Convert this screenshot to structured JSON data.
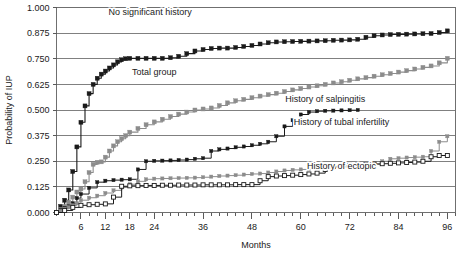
{
  "chart_data": {
    "type": "line",
    "title": "",
    "xlabel": "Months",
    "ylabel": "Probability of IUP",
    "xlim": [
      0,
      98
    ],
    "ylim": [
      0,
      1.0
    ],
    "grid": true,
    "legend_position": "inline-annotations",
    "xticklabels": [
      "6",
      "12",
      "18",
      "24",
      "36",
      "48",
      "60",
      "72",
      "84",
      "96"
    ],
    "xtickvalues": [
      6,
      12,
      18,
      24,
      36,
      48,
      60,
      72,
      84,
      96
    ],
    "xtick_minor_step": 2,
    "yticklabels": [
      "0.000",
      "0.125",
      "0.250",
      "0.375",
      "0.500",
      "0.625",
      "0.750",
      "0.875",
      "1.000"
    ],
    "ytickvalues": [
      0.0,
      0.125,
      0.25,
      0.375,
      0.5,
      0.625,
      0.75,
      0.875,
      1.0
    ],
    "series": [
      {
        "name": "No significant history",
        "color": "#1a1a1a",
        "marker": "filled-square",
        "label_x": 23,
        "label_y": 0.965,
        "x": [
          0,
          1,
          2,
          3,
          4,
          5,
          6,
          7,
          8,
          9,
          10,
          11,
          12,
          13,
          14,
          15,
          16,
          17,
          18,
          20,
          22,
          24,
          26,
          28,
          30,
          32,
          34,
          36,
          38,
          40,
          42,
          44,
          46,
          48,
          50,
          52,
          54,
          56,
          58,
          60,
          62,
          64,
          66,
          68,
          70,
          72,
          74,
          76,
          78,
          80,
          82,
          84,
          86,
          88,
          90,
          92,
          94,
          96
        ],
        "y": [
          0.0,
          0.03,
          0.06,
          0.11,
          0.2,
          0.32,
          0.44,
          0.52,
          0.58,
          0.625,
          0.655,
          0.675,
          0.69,
          0.705,
          0.72,
          0.735,
          0.745,
          0.75,
          0.752,
          0.752,
          0.752,
          0.752,
          0.752,
          0.755,
          0.762,
          0.775,
          0.788,
          0.795,
          0.8,
          0.802,
          0.802,
          0.805,
          0.81,
          0.815,
          0.822,
          0.828,
          0.832,
          0.833,
          0.834,
          0.835,
          0.836,
          0.837,
          0.838,
          0.84,
          0.841,
          0.842,
          0.845,
          0.855,
          0.862,
          0.866,
          0.868,
          0.869,
          0.87,
          0.871,
          0.872,
          0.873,
          0.878,
          0.886
        ]
      },
      {
        "name": "Total group",
        "color": "#8c8c8c",
        "marker": "filled-square",
        "label_x": 24,
        "label_y": 0.672,
        "x": [
          0,
          1,
          2,
          3,
          4,
          5,
          6,
          7,
          8,
          9,
          10,
          11,
          12,
          13,
          14,
          15,
          16,
          17,
          18,
          20,
          22,
          24,
          26,
          28,
          30,
          32,
          34,
          36,
          38,
          40,
          42,
          44,
          46,
          48,
          50,
          52,
          54,
          56,
          58,
          60,
          62,
          64,
          66,
          68,
          70,
          72,
          74,
          76,
          78,
          80,
          82,
          84,
          86,
          88,
          90,
          92,
          94,
          96
        ],
        "y": [
          0.0,
          0.015,
          0.03,
          0.05,
          0.075,
          0.1,
          0.115,
          0.15,
          0.195,
          0.235,
          0.245,
          0.247,
          0.27,
          0.3,
          0.325,
          0.345,
          0.36,
          0.375,
          0.392,
          0.41,
          0.428,
          0.442,
          0.455,
          0.468,
          0.48,
          0.49,
          0.5,
          0.505,
          0.51,
          0.522,
          0.535,
          0.545,
          0.552,
          0.56,
          0.568,
          0.575,
          0.582,
          0.59,
          0.598,
          0.605,
          0.612,
          0.618,
          0.625,
          0.632,
          0.638,
          0.645,
          0.652,
          0.658,
          0.665,
          0.672,
          0.678,
          0.685,
          0.692,
          0.7,
          0.708,
          0.715,
          0.73,
          0.752
        ]
      },
      {
        "name": "History of salpingitis",
        "color": "#1a1a1a",
        "marker": "filled-square-small",
        "label_x": 66,
        "label_y": 0.54,
        "x": [
          0,
          1,
          2,
          3,
          4,
          5,
          6,
          8,
          10,
          12,
          14,
          16,
          18,
          20,
          22,
          24,
          26,
          28,
          30,
          32,
          34,
          36,
          38,
          40,
          42,
          44,
          46,
          48,
          50,
          52,
          54,
          56,
          58,
          60,
          62,
          64,
          66,
          68,
          70,
          72,
          74
        ],
        "y": [
          0.0,
          0.012,
          0.022,
          0.03,
          0.045,
          0.07,
          0.09,
          0.12,
          0.148,
          0.155,
          0.158,
          0.16,
          0.162,
          0.21,
          0.25,
          0.252,
          0.253,
          0.254,
          0.256,
          0.258,
          0.262,
          0.265,
          0.3,
          0.308,
          0.312,
          0.318,
          0.322,
          0.328,
          0.335,
          0.345,
          0.372,
          0.42,
          0.45,
          0.478,
          0.49,
          0.494,
          0.496,
          0.497,
          0.498,
          0.499,
          0.5
        ]
      },
      {
        "name": "History of tubal infertility",
        "color": "#8c8c8c",
        "marker": "filled-square-small",
        "label_x": 70,
        "label_y": 0.428,
        "x": [
          0,
          1,
          2,
          3,
          4,
          5,
          6,
          8,
          10,
          12,
          14,
          16,
          18,
          20,
          22,
          24,
          26,
          28,
          30,
          32,
          34,
          36,
          38,
          40,
          42,
          44,
          46,
          48,
          50,
          52,
          54,
          56,
          58,
          60,
          62,
          64,
          66,
          68,
          70,
          72,
          74,
          76,
          78,
          80,
          82,
          84,
          86,
          88,
          90,
          92,
          94,
          96
        ],
        "y": [
          0.0,
          0.008,
          0.018,
          0.026,
          0.035,
          0.045,
          0.06,
          0.072,
          0.082,
          0.095,
          0.108,
          0.122,
          0.138,
          0.152,
          0.162,
          0.165,
          0.166,
          0.167,
          0.168,
          0.169,
          0.17,
          0.172,
          0.175,
          0.178,
          0.18,
          0.182,
          0.185,
          0.188,
          0.19,
          0.195,
          0.2,
          0.205,
          0.208,
          0.21,
          0.212,
          0.215,
          0.218,
          0.22,
          0.222,
          0.225,
          0.228,
          0.232,
          0.238,
          0.25,
          0.262,
          0.265,
          0.268,
          0.27,
          0.272,
          0.3,
          0.345,
          0.372
        ]
      },
      {
        "name": "History of ectopic",
        "color": "#1a1a1a",
        "marker": "open-square",
        "label_x": 70,
        "label_y": 0.212,
        "x": [
          0,
          2,
          4,
          6,
          8,
          10,
          12,
          14,
          16,
          18,
          20,
          22,
          24,
          26,
          28,
          30,
          32,
          34,
          36,
          38,
          40,
          42,
          44,
          46,
          48,
          50,
          52,
          54,
          56,
          58,
          60,
          62,
          64,
          66,
          68,
          70,
          72,
          74,
          76,
          78,
          80,
          82,
          84,
          86,
          88,
          90,
          92,
          94,
          96
        ],
        "y": [
          0.0,
          0.01,
          0.025,
          0.035,
          0.038,
          0.04,
          0.042,
          0.075,
          0.128,
          0.13,
          0.131,
          0.132,
          0.132,
          0.133,
          0.133,
          0.134,
          0.134,
          0.134,
          0.135,
          0.135,
          0.135,
          0.135,
          0.136,
          0.136,
          0.136,
          0.155,
          0.175,
          0.178,
          0.18,
          0.182,
          0.185,
          0.188,
          0.192,
          0.21,
          0.225,
          0.228,
          0.23,
          0.232,
          0.234,
          0.236,
          0.238,
          0.24,
          0.242,
          0.244,
          0.246,
          0.25,
          0.272,
          0.278,
          0.278
        ]
      }
    ]
  }
}
